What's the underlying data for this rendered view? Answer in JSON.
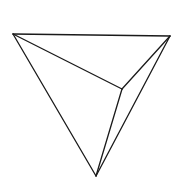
{
  "diagram": {
    "title": "",
    "type": "tetrahedron-line-drawing",
    "colors": {
      "stroke": "#1a1a1a",
      "background": "#ffffff"
    },
    "vertices": {
      "A": [
        13,
        34
      ],
      "B": [
        170,
        36
      ],
      "C": [
        122,
        89
      ],
      "D": [
        96,
        176
      ]
    },
    "edges": [
      [
        "A",
        "B"
      ],
      [
        "A",
        "C"
      ],
      [
        "B",
        "C"
      ],
      [
        "A",
        "D"
      ],
      [
        "B",
        "D"
      ],
      [
        "C",
        "D"
      ]
    ]
  }
}
